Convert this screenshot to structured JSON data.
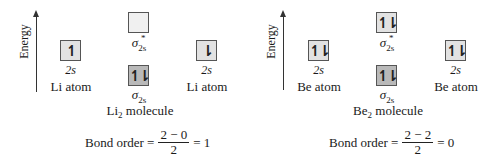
{
  "diagrams": [
    {
      "id": "li2",
      "axis_label": "Energy",
      "left_atom": {
        "orbital_label": "2s",
        "electrons": "↿",
        "name": "Li atom"
      },
      "right_atom": {
        "orbital_label": "2s",
        "electrons": "⇂",
        "name": "Li atom"
      },
      "antibonding": {
        "symbol": "σ",
        "sup": "*",
        "sub": "2s",
        "electrons": ""
      },
      "bonding": {
        "symbol": "σ",
        "sub": "2s",
        "electrons": "↿⇂"
      },
      "molecule": {
        "base": "Li",
        "sub": "2",
        "rest": " molecule"
      },
      "bond_order": {
        "label": "Bond order =",
        "numerator": "2 − 0",
        "denominator": "2",
        "result": "= 1"
      }
    },
    {
      "id": "be2",
      "axis_label": "Energy",
      "left_atom": {
        "orbital_label": "2s",
        "electrons": "↿⇂",
        "name": "Be atom"
      },
      "right_atom": {
        "orbital_label": "2s",
        "electrons": "↿⇂",
        "name": "Be atom"
      },
      "antibonding": {
        "symbol": "σ",
        "sup": "*",
        "sub": "2s",
        "electrons": "↿⇂"
      },
      "bonding": {
        "symbol": "σ",
        "sub": "2s",
        "electrons": "↿⇂"
      },
      "molecule": {
        "base": "Be",
        "sub": "2",
        "rest": " molecule"
      },
      "bond_order": {
        "label": "Bond order =",
        "numerator": "2 − 2",
        "denominator": "2",
        "result": "= 0"
      }
    }
  ],
  "colors": {
    "atomic_box": "#e2e2e2",
    "bonding_box": "#b9b9b9",
    "antibonding_box": "#f0f0f0",
    "stroke": "#555555"
  }
}
